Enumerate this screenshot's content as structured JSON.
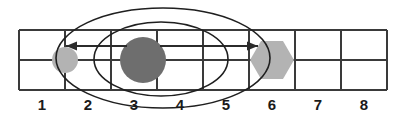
{
  "figure": {
    "width": 409,
    "height": 118,
    "background": "#ffffff"
  },
  "grid": {
    "cells": 8,
    "rows": 2,
    "x_start": 19,
    "x_end": 387,
    "y_top": 30,
    "y_mid": 60,
    "y_bottom": 90,
    "line_color": "#3a3a3a",
    "line_width": 2
  },
  "axis": {
    "labels": [
      "1",
      "2",
      "3",
      "4",
      "5",
      "6",
      "7",
      "8"
    ],
    "label_y": 110,
    "label_color": "#1a1a1a"
  },
  "shapes": [
    {
      "name": "light-circle-position-1",
      "type": "circle",
      "position_label": "1",
      "cx": 65,
      "cy": 60,
      "r": 13,
      "fill": "#b3b3b3"
    },
    {
      "name": "dark-circle-position-3",
      "type": "circle",
      "position_label": "3",
      "cx": 143,
      "cy": 60,
      "r": 23,
      "fill": "#6e6e6e"
    },
    {
      "name": "light-hexagon-position-6",
      "type": "hexagon",
      "position_label": "6",
      "cx": 272,
      "cy": 60,
      "r": 22,
      "fill": "#b3b3b3"
    }
  ],
  "arrows": [
    {
      "name": "left-arrow",
      "direction": "left",
      "from_x": 127,
      "to_x": 66,
      "y": 46,
      "color": "#2b2b2b"
    },
    {
      "name": "right-arrow",
      "direction": "right",
      "from_x": 160,
      "to_x": 258,
      "y": 46,
      "color": "#2b2b2b"
    }
  ],
  "ellipses": [
    {
      "name": "outer-ellipse",
      "cx": 163,
      "cy": 58,
      "rx": 107,
      "ry": 50,
      "stroke": "#1f1f1f",
      "stroke_width": 1.6
    },
    {
      "name": "inner-ellipse",
      "cx": 161,
      "cy": 59,
      "rx": 67,
      "ry": 37,
      "stroke": "#1f1f1f",
      "stroke_width": 1.6
    }
  ]
}
